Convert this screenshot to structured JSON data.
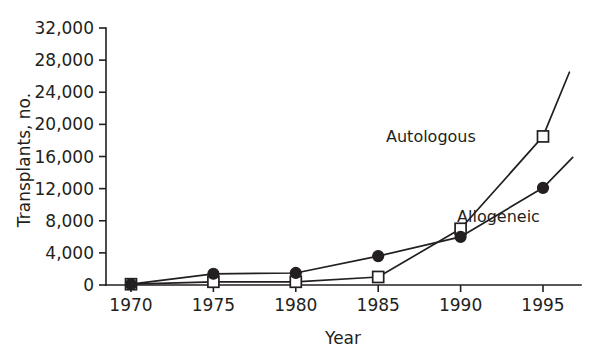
{
  "chart_data": {
    "type": "line",
    "title": "",
    "xlabel": "Year",
    "ylabel": "Transplants, no.",
    "x": [
      1970,
      1975,
      1980,
      1985,
      1990,
      1995
    ],
    "xlim": [
      1968,
      1997
    ],
    "ylim": [
      0,
      32000
    ],
    "grid": false,
    "legend_position": "inline-annotations",
    "xticks": [
      "1970",
      "1975",
      "1980",
      "1985",
      "1990",
      "1995"
    ],
    "yticks": [
      "0",
      "4,000",
      "8,000",
      "12,000",
      "16,000",
      "20,000",
      "24,000",
      "28,000",
      "32,000"
    ],
    "ytick_values": [
      0,
      4000,
      8000,
      12000,
      16000,
      20000,
      24000,
      28000,
      32000
    ],
    "series": [
      {
        "name": "Autologous",
        "marker": "open-square",
        "values": [
          100,
          400,
          400,
          1000,
          7000,
          18500
        ],
        "extension_point": {
          "x": 1996.6,
          "y": 26500
        }
      },
      {
        "name": "Allogeneic",
        "marker": "filled-circle",
        "values": [
          100,
          1400,
          1500,
          3600,
          6000,
          12100
        ],
        "extension_point": {
          "x": 1996.8,
          "y": 15900
        }
      }
    ],
    "annotations": [
      {
        "text": "Autologous",
        "x": 1988.2,
        "y": 17800
      },
      {
        "text": "Allogeneic",
        "x": 1992.3,
        "y": 7900
      }
    ],
    "colors": {
      "ink": "#231f20",
      "background": "#ffffff"
    }
  }
}
